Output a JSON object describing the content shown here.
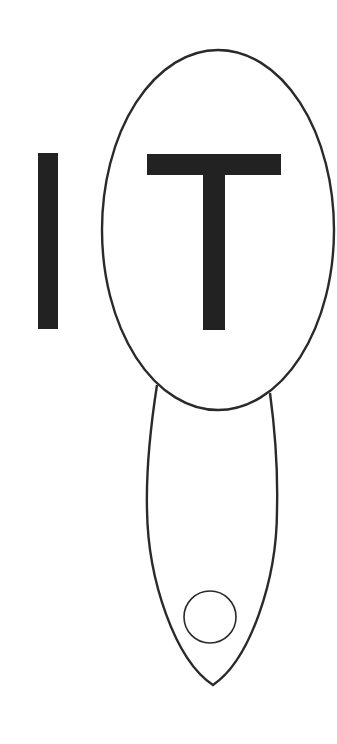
{
  "diagram": {
    "letters": [
      {
        "char": "I",
        "color": "#222222"
      },
      {
        "char": "T",
        "color": "#222222"
      }
    ],
    "word": "IT",
    "shapes": {
      "stroke_color": "#2a2a2a",
      "background": "#ffffff",
      "head_ellipse": {
        "label": "large oval enclosing T"
      },
      "handle_shape": {
        "label": "elongated lower lobe"
      },
      "small_circle": {
        "label": "small circle in lower lobe"
      }
    }
  }
}
